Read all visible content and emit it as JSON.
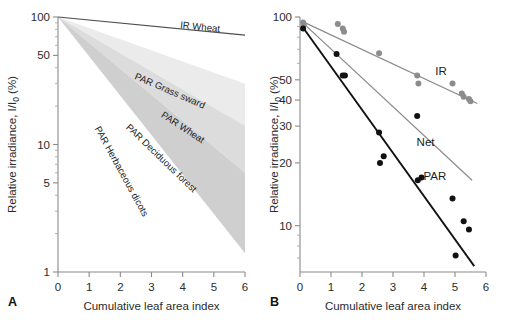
{
  "figure": {
    "panel_a_letter": "A",
    "panel_b_letter": "B",
    "xlabel": "Cumulative leaf area index",
    "ylabel": "Relative irradiance, I/I0 (%)",
    "ylabel_parts": {
      "pre": "Relative irradiance, I/I",
      "sub": "0",
      "post": " (%)"
    }
  },
  "chart_data": [
    {
      "id": "panel-a",
      "type": "area",
      "title": "",
      "xlabel": "Cumulative leaf area index",
      "ylabel": "Relative irradiance, I/I0 (%)",
      "xlim": [
        0,
        6
      ],
      "ylim": [
        1,
        100
      ],
      "yscale": "log",
      "grid": false,
      "legend": "inline-rotated-labels",
      "xticks": [
        0,
        1,
        2,
        3,
        4,
        5,
        6
      ],
      "yticks": [
        1,
        5,
        10,
        50,
        100
      ],
      "ytick_labels": [
        "1",
        "5",
        "10",
        "50",
        "100"
      ],
      "yminor": [
        2,
        3,
        4,
        6,
        7,
        8,
        9,
        20,
        30,
        40,
        60,
        70,
        80,
        90
      ],
      "lines": [
        {
          "name": "IR Wheat",
          "label": "IR Wheat",
          "color": "#4d4d4d",
          "x": [
            0,
            6
          ],
          "y": [
            100,
            72
          ],
          "k_extinction": 0.055,
          "label_x": 4.55,
          "label_y": 79
        }
      ],
      "wedges": [
        {
          "name": "PAR Grass sward",
          "label": "PAR Grass sward",
          "color": "#ebebeb",
          "x_start": 0,
          "x_end": 6,
          "y_start": 100,
          "y_upper_end": 30,
          "y_lower_end": 14,
          "k_upper": 0.2,
          "k_lower": 0.33,
          "label_x": 3.55,
          "label_y": 25
        },
        {
          "name": "PAR Wheat",
          "label": "PAR Wheat",
          "color": "#dcdcdc",
          "x_start": 0,
          "x_end": 6,
          "y_start": 100,
          "y_upper_end": 14,
          "y_lower_end": 6,
          "k_upper": 0.33,
          "k_lower": 0.47,
          "label_x": 3.95,
          "label_y": 13
        },
        {
          "name": "PAR Deciduous forest",
          "label": "PAR Deciduous forest",
          "color": "#cfcfcf",
          "x_start": 0,
          "x_end": 6,
          "y_start": 100,
          "y_upper_end": 6,
          "y_lower_end": 1.4,
          "k_upper": 0.47,
          "k_lower": 0.71,
          "label_x": 3.25,
          "label_y": 7.5
        },
        {
          "name": "PAR Herbaceous dicots",
          "label": "PAR Herbaceous dicots",
          "color": "#c4c4c4",
          "x_start": 0,
          "x_end": 4.95,
          "y_start": 100,
          "y_upper_end": 1.4,
          "y_lower_end": 1.4,
          "k_upper": 0.86,
          "k_lower": 1.37,
          "label_x": 1.95,
          "label_y": 6.0
        }
      ]
    },
    {
      "id": "panel-b",
      "type": "scatter",
      "title": "",
      "xlabel": "Cumulative leaf area index",
      "ylabel": "Relative irradiance, I/I0 (%)",
      "xlim": [
        0,
        6
      ],
      "ylim": [
        6,
        100
      ],
      "yscale": "log",
      "grid": false,
      "legend": "inline",
      "xticks": [
        0,
        1,
        2,
        3,
        4,
        5,
        6
      ],
      "yticks": [
        10,
        20,
        30,
        40,
        50,
        100
      ],
      "ytick_labels": [
        "10",
        "20",
        "30",
        "40",
        "50",
        "100"
      ],
      "yminor": [
        7,
        8,
        9,
        60,
        70,
        80,
        90
      ],
      "series": [
        {
          "name": "IR",
          "label": "IR",
          "color": "#8c8c8c",
          "marker": "circle",
          "points": [
            [
              0.1,
              94.0
            ],
            [
              0.12,
              92.0
            ],
            [
              1.22,
              92.5
            ],
            [
              1.38,
              88.0
            ],
            [
              1.42,
              85.0
            ],
            [
              2.55,
              67.0
            ],
            [
              3.78,
              52.5
            ],
            [
              3.82,
              48.0
            ],
            [
              4.92,
              48.0
            ],
            [
              5.22,
              43.0
            ],
            [
              5.28,
              41.5
            ],
            [
              5.45,
              40.5
            ],
            [
              5.5,
              39.5
            ]
          ],
          "fit": {
            "x": [
              0.05,
              5.72
            ],
            "y": [
              95.5,
              38.5
            ]
          },
          "label_x": 4.55,
          "label_y": 53
        },
        {
          "name": "Net",
          "label": "Net",
          "color": "#8c8c8c",
          "marker": "none",
          "points": [],
          "fit": {
            "x": [
              0.05,
              5.55
            ],
            "y": [
              95.0,
              16.5
            ]
          },
          "label_x": 4.05,
          "label_y": 24
        },
        {
          "name": "PAR",
          "label": "PAR",
          "color": "#111111",
          "marker": "circle",
          "points": [
            [
              0.1,
              88.0
            ],
            [
              1.18,
              66.5
            ],
            [
              1.38,
              52.5
            ],
            [
              1.45,
              52.5
            ],
            [
              2.55,
              28.0
            ],
            [
              2.58,
              20.0
            ],
            [
              2.7,
              21.5
            ],
            [
              3.78,
              33.5
            ],
            [
              3.8,
              16.5
            ],
            [
              3.92,
              17.0
            ],
            [
              4.92,
              13.5
            ],
            [
              5.02,
              7.2
            ],
            [
              5.28,
              10.5
            ],
            [
              5.45,
              9.6
            ]
          ],
          "fit": {
            "x": [
              0.05,
              5.62
            ],
            "y": [
              91.0,
              6.4
            ]
          },
          "label_x": 4.35,
          "label_y": 16.5
        }
      ]
    }
  ]
}
